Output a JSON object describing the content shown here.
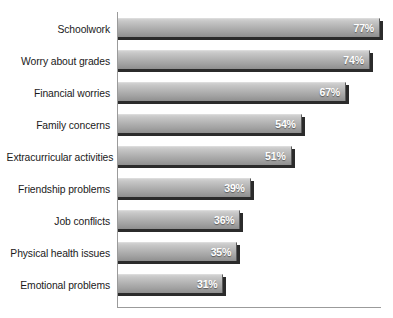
{
  "chart_data": {
    "type": "bar",
    "orientation": "horizontal",
    "title": "",
    "xlabel": "",
    "ylabel": "",
    "xlim": [
      0,
      80
    ],
    "grid": false,
    "legend": null,
    "value_suffix": "%",
    "categories": [
      "Schoolwork",
      "Worry about grades",
      "Financial worries",
      "Family concerns",
      "Extracurricular activities",
      "Friendship problems",
      "Job conflicts",
      "Physical health issues",
      "Emotional problems"
    ],
    "values": [
      77,
      74,
      67,
      54,
      51,
      39,
      36,
      35,
      31
    ],
    "value_labels": [
      "77%",
      "74%",
      "67%",
      "54%",
      "51%",
      "39%",
      "36%",
      "35%",
      "31%"
    ],
    "bars": [
      {
        "label": "Schoolwork",
        "value": 77,
        "value_label": "77%"
      },
      {
        "label": "Worry about grades",
        "value": 74,
        "value_label": "74%"
      },
      {
        "label": "Financial worries",
        "value": 67,
        "value_label": "67%"
      },
      {
        "label": "Family concerns",
        "value": 54,
        "value_label": "54%"
      },
      {
        "label": "Extracurricular activities",
        "value": 51,
        "value_label": "51%"
      },
      {
        "label": "Friendship problems",
        "value": 39,
        "value_label": "39%"
      },
      {
        "label": "Job conflicts",
        "value": 36,
        "value_label": "36%"
      },
      {
        "label": "Physical health issues",
        "value": 35,
        "value_label": "35%"
      },
      {
        "label": "Emotional problems",
        "value": 31,
        "value_label": "31%"
      }
    ],
    "colors": {
      "bar_top": "#d2d2d2",
      "bar_bottom": "#8f8f8f",
      "bar_shadow": "#2b2b2b",
      "axis": "#9b9b9b",
      "category_text": "#1a1a1a",
      "value_text": "#ffffff",
      "background": "#ffffff"
    }
  },
  "title_remnant": ""
}
